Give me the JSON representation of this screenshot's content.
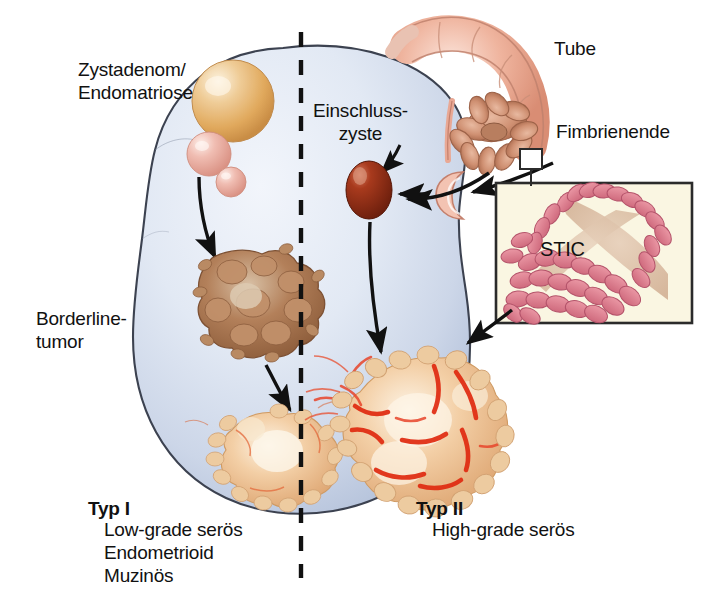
{
  "figure": {
    "background_color": "#ffffff"
  },
  "labels": {
    "zystadenom": "Zystadenom/\nEndomatriose",
    "einschlusszyste": "Einschluss-\nzyste",
    "tube": "Tube",
    "fimbrienende": "Fimbrienende",
    "borderline": "Borderline-\ntumor",
    "stic": "STIC",
    "typ1_title": "Typ I",
    "typ1_entities": "Low-grade serös\nEndometrioid\nMuzinös",
    "typ2_title": "Typ II",
    "typ2_entities": "High-grade serös"
  },
  "colors": {
    "ovary_fill_light": "#e8edf6",
    "ovary_fill_mid": "#ccd6e8",
    "ovary_fill_shadow": "#b7c4dc",
    "ovary_outline": "#3c4250",
    "cyst_large": "#e0a759",
    "cyst_small": "#e9a79c",
    "inclusion_cyst": "#8e2a16",
    "borderline_tumor": "#a9714a",
    "carcinoma_tan": "#eab98e",
    "carcinoma_hemorrhage": "#e03014",
    "tube_pink": "#e9a894",
    "tube_outline": "#c4806d",
    "stic_box_bg": "#faf6e2",
    "stic_box_border": "#2b2b2b",
    "stic_cells": "#dd7f8e",
    "stic_lumen": "#e0c6b0",
    "divider_dash": "#111111",
    "arrow": "#111111",
    "text": "#111111"
  },
  "elements": {
    "divider": {
      "name": "dashed-vertical-divider",
      "orientation": "vertical"
    },
    "ovary": {
      "name": "ovary-body",
      "shape": "lobulated-oval"
    },
    "arrows": [
      {
        "name": "arrow-cyst-to-borderline",
        "from": "cortical-cysts",
        "to": "borderline-tumor"
      },
      {
        "name": "arrow-borderline-to-typ1-carcinoma",
        "from": "borderline-tumor",
        "to": "type-1-carcinoma"
      },
      {
        "name": "arrow-fimbria-to-inclusion-cyst",
        "from": "fimbrial-end",
        "to": "inclusion-cyst"
      },
      {
        "name": "arrow-surface-to-inclusion-cyst",
        "from": "ovarian-surface-invagination",
        "to": "inclusion-cyst"
      },
      {
        "name": "arrow-inclusion-cyst-to-typ2-carcinoma",
        "from": "inclusion-cyst",
        "to": "type-2-carcinoma"
      },
      {
        "name": "arrow-stic-to-typ2-carcinoma",
        "from": "stic-inset",
        "to": "type-2-carcinoma"
      }
    ]
  }
}
